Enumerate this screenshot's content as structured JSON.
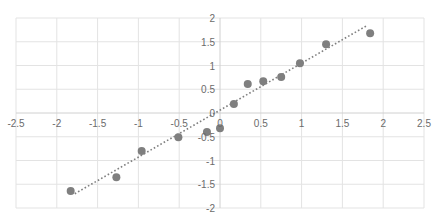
{
  "chart_data": {
    "type": "scatter",
    "title": "",
    "xlabel": "",
    "ylabel": "",
    "xlim": [
      -2.5,
      2.5
    ],
    "ylim": [
      -2,
      2
    ],
    "x_ticks": [
      -2.5,
      -2,
      -1.5,
      -1,
      -0.5,
      0,
      0.5,
      1,
      1.5,
      2,
      2.5
    ],
    "x_tick_labels": [
      "-2.5",
      "-2",
      "-1.5",
      "-1",
      "-0.5",
      "0",
      "0.5",
      "1",
      "1.5",
      "2",
      "2.5"
    ],
    "y_ticks": [
      -2,
      -1.5,
      -1,
      -0.5,
      0,
      0.5,
      1,
      1.5,
      2
    ],
    "y_tick_labels": [
      "-2",
      "-1.5",
      "-1",
      "-0.5",
      "0",
      "0.5",
      "1",
      "1.5",
      "2"
    ],
    "grid": true,
    "legend": null,
    "series": [
      {
        "name": "data",
        "marker": "circle",
        "color": "#7f7f7f",
        "points": [
          {
            "x": -1.83,
            "y": -1.64
          },
          {
            "x": -1.27,
            "y": -1.35
          },
          {
            "x": -0.96,
            "y": -0.8
          },
          {
            "x": -0.51,
            "y": -0.51
          },
          {
            "x": -0.16,
            "y": -0.4
          },
          {
            "x": 0.0,
            "y": -0.32
          },
          {
            "x": 0.17,
            "y": 0.19
          },
          {
            "x": 0.34,
            "y": 0.61
          },
          {
            "x": 0.53,
            "y": 0.67
          },
          {
            "x": 0.75,
            "y": 0.76
          },
          {
            "x": 0.98,
            "y": 1.05
          },
          {
            "x": 1.3,
            "y": 1.45
          },
          {
            "x": 1.84,
            "y": 1.68
          }
        ]
      }
    ],
    "trendline": {
      "type": "linear",
      "style": "dotted",
      "color": "#7f7f7f",
      "from": {
        "x": -1.78,
        "y": -1.7
      },
      "to": {
        "x": 1.79,
        "y": 1.83
      }
    }
  },
  "colors": {
    "grid": "#e3e3e3",
    "axis": "#d0d0d0",
    "tick_label": "#6b6b6b",
    "marker": "#7f7f7f"
  }
}
